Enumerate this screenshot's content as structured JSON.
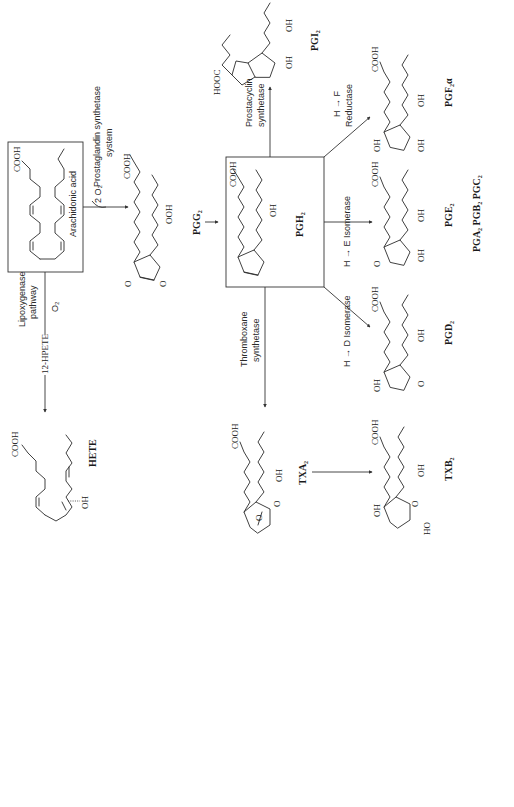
{
  "diagram": {
    "orientation": "rotated-90-ccw",
    "colors": {
      "ink": "#2b2b2b",
      "background": "#ffffff"
    },
    "compounds": {
      "arachidonic_acid": {
        "label": "Arachidonic acid",
        "group": "COOH"
      },
      "pgg2": {
        "label": "PGG₂",
        "groups": [
          "COOH",
          "OOH",
          "O",
          "O"
        ]
      },
      "pgh2": {
        "label": "PGH₂",
        "groups": [
          "COOH",
          "OH",
          "O",
          "O"
        ]
      },
      "pgi2": {
        "label": "PGI₂",
        "groups": [
          "HOOC",
          "O",
          "OH",
          "OH"
        ]
      },
      "pgf2a": {
        "label": "PGF₂α",
        "groups": [
          "COOH",
          "OH",
          "OH",
          "OH"
        ]
      },
      "pge2": {
        "label": "PGE₂",
        "groups": [
          "COOH",
          "O",
          "OH",
          "OH"
        ],
        "derivatives": "PGA₂ PGB₂ PGC₂"
      },
      "pgd2": {
        "label": "PGD₂",
        "groups": [
          "COOH",
          "OH",
          "O",
          "OH"
        ]
      },
      "txa2": {
        "label": "TXA₂",
        "groups": [
          "COOH",
          "O",
          "O",
          "OH"
        ]
      },
      "txb2": {
        "label": "TXB₂",
        "groups": [
          "COOH",
          "OH",
          "O",
          "HO",
          "OH"
        ]
      },
      "hete": {
        "label": "HETE",
        "groups": [
          "COOH",
          "OH"
        ]
      },
      "hpete": {
        "label": "12-HPETE"
      }
    },
    "enzymes": {
      "pg_synthetase_line1": "Prostaglandin synthetase",
      "pg_synthetase_line2": "system",
      "two_o2": "2 O₂",
      "lipoxygenase_line1": "Lipoxygenase",
      "lipoxygenase_line2": "pathway",
      "o2": "O₂",
      "prostacyclin_line1": "Prostacyclin",
      "prostacyclin_line2": "synthetase",
      "h_to_f_line1": "H → F",
      "h_to_f_line2": "Reductase",
      "h_to_e": "H → E Isomerase",
      "h_to_d": "H → D Isomerase",
      "thromboxane_line1": "Thromboxane",
      "thromboxane_line2": "synthetase"
    }
  }
}
